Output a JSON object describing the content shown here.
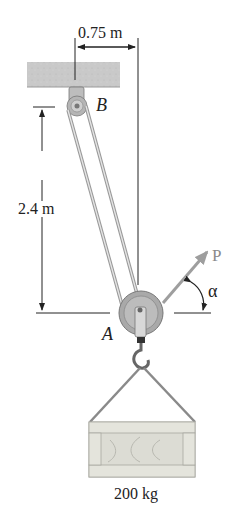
{
  "figure": {
    "type": "pulley-system statics diagram",
    "labels": {
      "horizontal_dimension": "0.75 m",
      "vertical_dimension": "2.4 m",
      "pulley_top": "B",
      "pulley_bottom": "A",
      "force": "P",
      "angle": "α",
      "mass": "200 kg"
    },
    "colors": {
      "ceiling": "#c9c9c9",
      "rope": "#b8b8b8",
      "pulley": "#a9a9a9",
      "force_arrow": "#9e9e9e",
      "crate": "#dcdcd4",
      "dimension_lines": "#222222"
    }
  }
}
